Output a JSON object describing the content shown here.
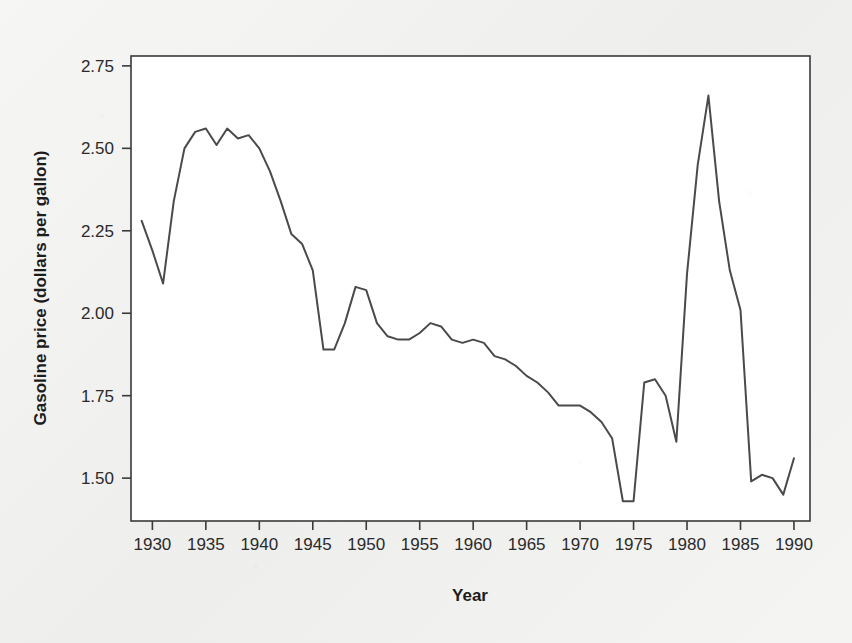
{
  "figure": {
    "background_color": "#f1f1ef",
    "plot_background_color": "#ffffff",
    "frame_color": "#3a3a3a"
  },
  "chart_data": {
    "type": "line",
    "title": "",
    "subtitle": "",
    "xlabel": "Year",
    "ylabel": "Gasoline price (dollars per gallon)",
    "xlim": [
      1928.0,
      1991.5
    ],
    "ylim": [
      1.37,
      2.78
    ],
    "xticks": [
      1930,
      1935,
      1940,
      1945,
      1950,
      1955,
      1960,
      1965,
      1970,
      1975,
      1980,
      1985,
      1990
    ],
    "xtick_labels": [
      "1930",
      "1935",
      "1940",
      "1945",
      "1950",
      "1955",
      "1960",
      "1965",
      "1970",
      "1975",
      "1980",
      "1985",
      "1990"
    ],
    "yticks": [
      1.5,
      1.75,
      2.0,
      2.25,
      2.5,
      2.75
    ],
    "ytick_labels": [
      "1.50",
      "1.75",
      "2.00",
      "2.25",
      "2.50",
      "2.75"
    ],
    "grid": false,
    "legend": false,
    "legend_position": "none",
    "line_color": "#4a4a4a",
    "line_width": 2.0,
    "markers": false,
    "series": [
      {
        "name": "Gasoline price (dollars per gallon)",
        "x": [
          1929,
          1930,
          1931,
          1932,
          1933,
          1934,
          1935,
          1936,
          1937,
          1938,
          1939,
          1940,
          1941,
          1942,
          1943,
          1944,
          1945,
          1946,
          1947,
          1948,
          1949,
          1950,
          1951,
          1952,
          1953,
          1954,
          1955,
          1956,
          1957,
          1958,
          1959,
          1960,
          1961,
          1962,
          1963,
          1964,
          1965,
          1966,
          1967,
          1968,
          1969,
          1970,
          1971,
          1972,
          1973,
          1974,
          1975,
          1976,
          1977,
          1978,
          1979,
          1980,
          1981,
          1982,
          1983,
          1984,
          1985,
          1986,
          1987,
          1988,
          1989,
          1990
        ],
        "values": [
          2.28,
          2.19,
          2.09,
          2.34,
          2.5,
          2.55,
          2.56,
          2.51,
          2.56,
          2.53,
          2.54,
          2.52,
          2.42,
          2.32,
          2.24,
          2.21,
          2.13,
          1.89,
          1.89,
          1.98,
          2.07,
          2.08,
          1.98,
          1.93,
          1.92,
          1.92,
          1.93,
          1.96,
          1.97,
          1.92,
          1.9,
          1.92,
          1.91,
          1.87,
          1.86,
          1.84,
          1.81,
          1.79,
          1.76,
          1.73,
          1.72,
          1.72,
          1.71,
          1.68,
          1.62,
          1.56,
          1.51,
          1.45,
          1.43,
          1.42,
          1.55,
          1.8,
          1.79,
          1.75,
          1.73,
          1.61,
          2.12,
          2.66,
          2.34,
          2.13,
          2.01,
          1.49
        ],
        "note_x_mapping": "values listed follow the drawn curve; see points array for the exact plotted vertices"
      }
    ],
    "points": [
      [
        1929,
        2.28
      ],
      [
        1930,
        2.185
      ],
      [
        1931,
        2.095
      ],
      [
        1932,
        2.34
      ],
      [
        1933,
        2.505
      ],
      [
        1934,
        2.553
      ],
      [
        1935,
        2.558
      ],
      [
        1936,
        2.515
      ],
      [
        1937,
        2.558
      ],
      [
        1938,
        2.528
      ],
      [
        1939,
        2.538
      ],
      [
        1940,
        2.5
      ],
      [
        1941,
        2.435
      ],
      [
        1942,
        2.345
      ],
      [
        1943,
        2.245
      ],
      [
        1944,
        2.215
      ],
      [
        1945,
        2.13
      ],
      [
        1946,
        1.893
      ],
      [
        1947,
        1.893
      ],
      [
        1948,
        1.975
      ],
      [
        1949,
        2.078
      ],
      [
        1950,
        2.072
      ],
      [
        1951,
        1.975
      ],
      [
        1952,
        1.928
      ],
      [
        1953,
        1.922
      ],
      [
        1954,
        1.925
      ],
      [
        1955,
        1.945
      ],
      [
        1956,
        1.968
      ],
      [
        1957,
        1.958
      ],
      [
        1958,
        1.923
      ],
      [
        1959,
        1.908
      ],
      [
        1960,
        1.925
      ],
      [
        1961,
        1.912
      ],
      [
        1962,
        1.873
      ],
      [
        1963,
        1.858
      ],
      [
        1964,
        1.842
      ],
      [
        1965,
        1.812
      ],
      [
        1966,
        1.788
      ],
      [
        1967,
        1.758
      ],
      [
        1968,
        1.725
      ],
      [
        1969,
        1.718
      ],
      [
        1970,
        1.718
      ],
      [
        1971,
        1.705
      ],
      [
        1972,
        1.672
      ],
      [
        1973,
        1.618
      ],
      [
        1974,
        1.558
      ],
      [
        1975,
        1.512
      ],
      [
        1976,
        1.452
      ],
      [
        1977,
        1.428
      ],
      [
        1978,
        1.422
      ],
      [
        1979,
        1.552
      ],
      [
        1980,
        1.802
      ],
      [
        1981,
        1.792
      ],
      [
        1982,
        1.752
      ],
      [
        1983,
        1.728
      ],
      [
        1984,
        1.612
      ],
      [
        1985,
        2.118
      ],
      [
        1986,
        2.662
      ],
      [
        1987,
        2.338
      ],
      [
        1988,
        2.128
      ],
      [
        1989,
        2.012
      ],
      [
        1990,
        1.492
      ]
    ],
    "plotted_points": [
      [
        1929,
        2.28
      ],
      [
        1930,
        2.19
      ],
      [
        1931,
        2.09
      ],
      [
        1932,
        2.34
      ],
      [
        1933,
        2.5
      ],
      [
        1934,
        2.55
      ],
      [
        1935,
        2.56
      ],
      [
        1936,
        2.51
      ],
      [
        1937,
        2.56
      ],
      [
        1938,
        2.53
      ],
      [
        1939,
        2.54
      ],
      [
        1940,
        2.5
      ],
      [
        1941,
        2.43
      ],
      [
        1942,
        2.34
      ],
      [
        1943,
        2.24
      ],
      [
        1944,
        2.21
      ],
      [
        1945,
        2.13
      ],
      [
        1946,
        1.89
      ],
      [
        1947,
        1.89
      ],
      [
        1948,
        1.97
      ],
      [
        1949,
        2.08
      ],
      [
        1950,
        2.07
      ],
      [
        1951,
        1.97
      ],
      [
        1952,
        1.93
      ],
      [
        1953,
        1.92
      ],
      [
        1954,
        1.92
      ],
      [
        1955,
        1.94
      ],
      [
        1956,
        1.97
      ],
      [
        1957,
        1.96
      ],
      [
        1958,
        1.92
      ],
      [
        1959,
        1.91
      ],
      [
        1960,
        1.92
      ],
      [
        1961,
        1.91
      ],
      [
        1962,
        1.87
      ],
      [
        1963,
        1.86
      ],
      [
        1964,
        1.84
      ],
      [
        1965,
        1.81
      ],
      [
        1966,
        1.79
      ],
      [
        1967,
        1.76
      ],
      [
        1968,
        1.72
      ],
      [
        1969,
        1.72
      ],
      [
        1970,
        1.72
      ],
      [
        1971,
        1.7
      ],
      [
        1972,
        1.67
      ],
      [
        1973,
        1.62
      ],
      [
        1974,
        1.43
      ],
      [
        1975,
        1.43
      ],
      [
        1976,
        1.79
      ],
      [
        1977,
        1.8
      ],
      [
        1978,
        1.75
      ],
      [
        1979,
        1.61
      ],
      [
        1980,
        2.12
      ],
      [
        1981,
        2.45
      ],
      [
        1982,
        2.66
      ],
      [
        1983,
        2.34
      ],
      [
        1984,
        2.13
      ],
      [
        1985,
        2.01
      ],
      [
        1986,
        1.49
      ],
      [
        1987,
        1.51
      ],
      [
        1988,
        1.5
      ],
      [
        1989,
        1.45
      ],
      [
        1990,
        1.56
      ]
    ],
    "annotations": [],
    "highlights": {
      "maximum": {
        "year": 1982,
        "value": 2.66
      },
      "minimum": {
        "year": 1974,
        "value": 1.42
      },
      "start": {
        "year": 1929,
        "value": 2.28
      },
      "end": {
        "year": 1990,
        "value": 1.56
      }
    }
  }
}
